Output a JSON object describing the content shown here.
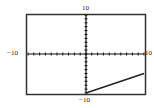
{
  "chart_data": {
    "type": "line",
    "title": "",
    "xlabel": "",
    "ylabel": "",
    "xlim": [
      -10,
      10
    ],
    "ylim": [
      -10,
      10
    ],
    "x_tick_step": 1,
    "y_tick_step": 1,
    "grid": false,
    "axis_labels": {
      "x_min": "−10",
      "x_max": "10",
      "y_min": "−10",
      "y_max": "10"
    },
    "series": [
      {
        "name": "f(x)",
        "x": [
          0,
          10
        ],
        "y": [
          -10,
          -5
        ]
      }
    ]
  },
  "colors": {
    "frame": "#333333",
    "axis": "#111111",
    "line": "#222222",
    "background": "#ffffff"
  }
}
